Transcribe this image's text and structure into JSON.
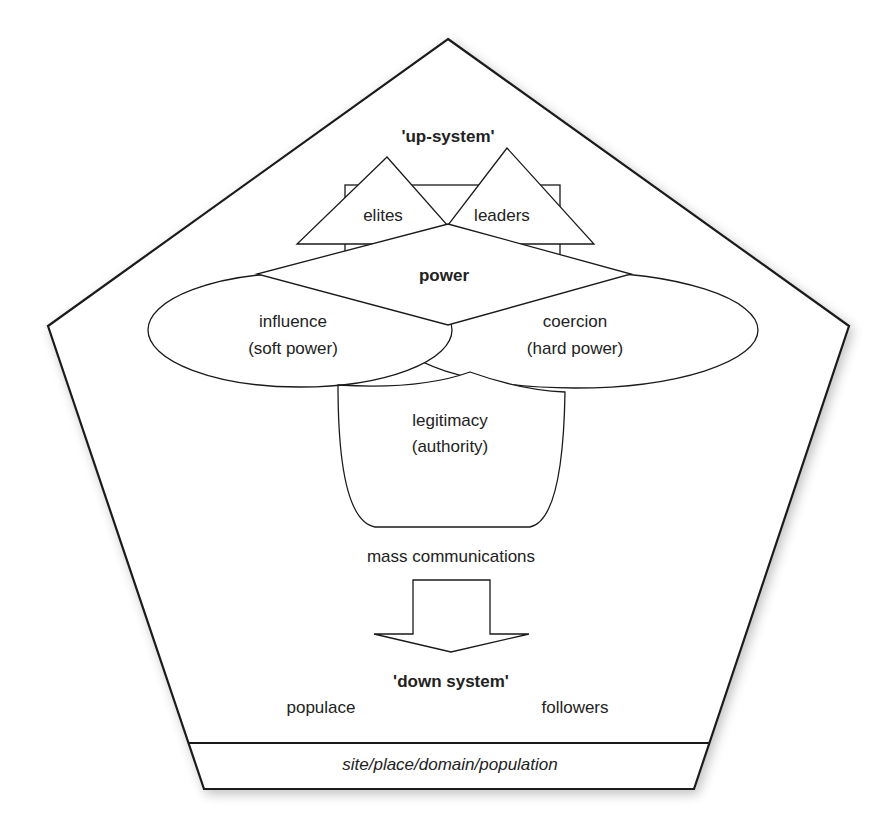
{
  "diagram": {
    "type": "power-structure-pentagon",
    "colors": {
      "line": "#1a1a1a",
      "text": "#222222",
      "fill": "#ffffff"
    },
    "up_system": {
      "title": "'up-system'"
    },
    "triangles": {
      "left": "elites",
      "right": "leaders"
    },
    "diamond": {
      "label": "power"
    },
    "ellipses": {
      "left": {
        "line1": "influence",
        "line2": "(soft power)"
      },
      "right": {
        "line1": "coercion",
        "line2": "(hard power)"
      }
    },
    "cup": {
      "line1": "legitimacy",
      "line2": "(authority)"
    },
    "arrow": {
      "label": "mass communications",
      "direction": "down"
    },
    "down_system": {
      "title": "'down system'",
      "left": "populace",
      "right": "followers"
    },
    "base": {
      "label": "site/place/domain/population"
    }
  }
}
